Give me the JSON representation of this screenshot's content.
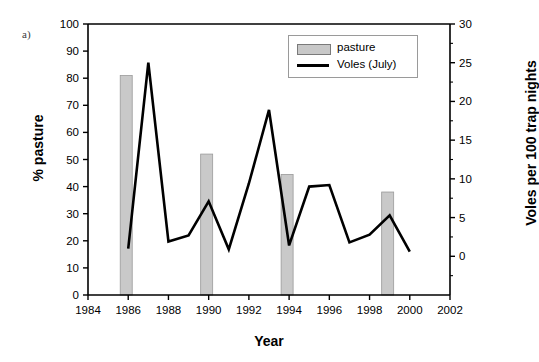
{
  "panel": {
    "label": "a)"
  },
  "legend": {
    "items": [
      {
        "label": "pasture",
        "marker": "bar-swatch",
        "color": "#c8c8c8"
      },
      {
        "label": "Voles (July)",
        "marker": "line-swatch",
        "color": "#000000"
      }
    ]
  },
  "chart_data": {
    "type": "bar",
    "title": "",
    "xlabel": "Year",
    "ylabel": "% pasture",
    "y2label": "Voles per 100 trap nights",
    "xlim": [
      1984,
      2002
    ],
    "ylim": [
      0,
      100
    ],
    "y2lim": [
      -5,
      30
    ],
    "grid": false,
    "legend_position": "top-right",
    "xticks": [
      1984,
      1986,
      1988,
      1990,
      1992,
      1994,
      1996,
      1998,
      2000,
      2002
    ],
    "yticks": [
      0,
      10,
      20,
      30,
      40,
      50,
      60,
      70,
      80,
      90,
      100
    ],
    "y2ticks": [
      0,
      5,
      10,
      15,
      20,
      25,
      30
    ],
    "series": [
      {
        "name": "pasture",
        "type": "bar",
        "axis": "left",
        "unit": "%",
        "x": [
          1986,
          1990,
          1994,
          1999
        ],
        "values": [
          81,
          52,
          44.5,
          38
        ]
      },
      {
        "name": "Voles (July)",
        "type": "line",
        "axis": "right",
        "unit": "voles per 100 trap nights",
        "x": [
          1986,
          1987,
          1988,
          1989,
          1990,
          1991,
          1992,
          1993,
          1994,
          1995,
          1996,
          1997,
          1998,
          1999,
          2000
        ],
        "values": [
          1.0,
          25.0,
          1.9,
          2.7,
          7.1,
          0.9,
          9.4,
          18.9,
          1.4,
          9.0,
          9.2,
          1.8,
          2.8,
          5.3,
          0.6
        ]
      }
    ]
  }
}
